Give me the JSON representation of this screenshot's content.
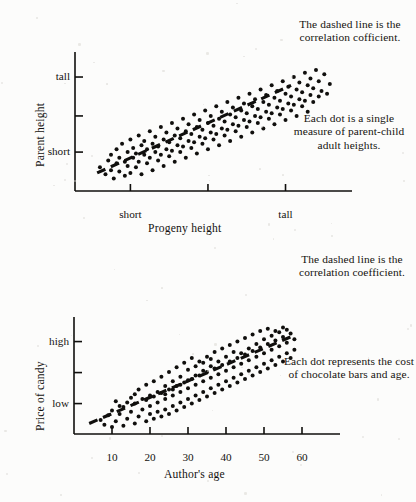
{
  "page": {
    "background_color": "#fcfcfb",
    "ink_color": "#100f0d"
  },
  "figures": [
    {
      "id": "parent-progeny-height",
      "notes": [
        {
          "id": "note-correlation",
          "text": "The dashed line is the correlation cofficient."
        },
        {
          "id": "note-dot-meaning",
          "text": "Each dot is a single measure of parent-child adult heights."
        }
      ],
      "chart_data": {
        "type": "scatter",
        "title": "",
        "xlabel": "Progeny height",
        "ylabel": "Parent height",
        "xlim": [
          0,
          100
        ],
        "ylim": [
          0,
          100
        ],
        "grid": false,
        "legend": "none",
        "xticks": [
          {
            "value": 20,
            "label": "short"
          },
          {
            "value": 48,
            "label": ""
          },
          {
            "value": 76,
            "label": "tall"
          }
        ],
        "yticks": [
          {
            "value": 82,
            "label": "tall"
          },
          {
            "value": 54,
            "label": ""
          },
          {
            "value": 28,
            "label": "short"
          }
        ],
        "annotation_line": {
          "style": "dashed",
          "label": "correlation cofficient",
          "x0": 8,
          "y0": 13,
          "x1": 78,
          "y1": 76
        },
        "points": [
          [
            9,
            17
          ],
          [
            11,
            12
          ],
          [
            12,
            22
          ],
          [
            13,
            15
          ],
          [
            13,
            26
          ],
          [
            14,
            9
          ],
          [
            15,
            20
          ],
          [
            15,
            30
          ],
          [
            16,
            14
          ],
          [
            16,
            24
          ],
          [
            17,
            34
          ],
          [
            18,
            11
          ],
          [
            18,
            21
          ],
          [
            19,
            28
          ],
          [
            19,
            18
          ],
          [
            20,
            37
          ],
          [
            20,
            13
          ],
          [
            21,
            24
          ],
          [
            21,
            31
          ],
          [
            22,
            17
          ],
          [
            22,
            27
          ],
          [
            23,
            40
          ],
          [
            23,
            21
          ],
          [
            24,
            33
          ],
          [
            24,
            12
          ],
          [
            25,
            26
          ],
          [
            25,
            36
          ],
          [
            26,
            20
          ],
          [
            26,
            30
          ],
          [
            27,
            43
          ],
          [
            27,
            24
          ],
          [
            28,
            34
          ],
          [
            28,
            15
          ],
          [
            29,
            28
          ],
          [
            29,
            39
          ],
          [
            30,
            22
          ],
          [
            30,
            32
          ],
          [
            31,
            46
          ],
          [
            31,
            26
          ],
          [
            32,
            37
          ],
          [
            32,
            18
          ],
          [
            33,
            30
          ],
          [
            33,
            42
          ],
          [
            34,
            25
          ],
          [
            34,
            35
          ],
          [
            35,
            49
          ],
          [
            35,
            29
          ],
          [
            36,
            40
          ],
          [
            36,
            21
          ],
          [
            37,
            33
          ],
          [
            37,
            45
          ],
          [
            38,
            28
          ],
          [
            38,
            38
          ],
          [
            39,
            52
          ],
          [
            39,
            32
          ],
          [
            40,
            43
          ],
          [
            40,
            24
          ],
          [
            41,
            36
          ],
          [
            41,
            48
          ],
          [
            42,
            31
          ],
          [
            42,
            41
          ],
          [
            43,
            55
          ],
          [
            43,
            35
          ],
          [
            44,
            46
          ],
          [
            44,
            27
          ],
          [
            45,
            39
          ],
          [
            45,
            51
          ],
          [
            46,
            34
          ],
          [
            46,
            44
          ],
          [
            47,
            58
          ],
          [
            47,
            38
          ],
          [
            48,
            49
          ],
          [
            48,
            30
          ],
          [
            49,
            42
          ],
          [
            49,
            54
          ],
          [
            50,
            37
          ],
          [
            50,
            47
          ],
          [
            51,
            61
          ],
          [
            51,
            41
          ],
          [
            52,
            52
          ],
          [
            52,
            33
          ],
          [
            53,
            45
          ],
          [
            53,
            57
          ],
          [
            54,
            40
          ],
          [
            54,
            50
          ],
          [
            55,
            64
          ],
          [
            55,
            44
          ],
          [
            56,
            55
          ],
          [
            56,
            36
          ],
          [
            57,
            48
          ],
          [
            57,
            60
          ],
          [
            58,
            43
          ],
          [
            58,
            53
          ],
          [
            59,
            67
          ],
          [
            59,
            47
          ],
          [
            60,
            58
          ],
          [
            60,
            39
          ],
          [
            61,
            51
          ],
          [
            61,
            63
          ],
          [
            62,
            46
          ],
          [
            62,
            56
          ],
          [
            63,
            70
          ],
          [
            63,
            50
          ],
          [
            64,
            61
          ],
          [
            64,
            42
          ],
          [
            65,
            54
          ],
          [
            65,
            66
          ],
          [
            66,
            49
          ],
          [
            66,
            59
          ],
          [
            67,
            73
          ],
          [
            67,
            53
          ],
          [
            68,
            64
          ],
          [
            68,
            45
          ],
          [
            69,
            57
          ],
          [
            69,
            69
          ],
          [
            70,
            52
          ],
          [
            70,
            62
          ],
          [
            71,
            76
          ],
          [
            71,
            56
          ],
          [
            72,
            67
          ],
          [
            72,
            48
          ],
          [
            73,
            60
          ],
          [
            73,
            72
          ],
          [
            74,
            55
          ],
          [
            74,
            65
          ],
          [
            75,
            79
          ],
          [
            75,
            59
          ],
          [
            76,
            70
          ],
          [
            76,
            51
          ],
          [
            77,
            63
          ],
          [
            77,
            75
          ],
          [
            78,
            58
          ],
          [
            78,
            68
          ],
          [
            79,
            82
          ],
          [
            79,
            62
          ],
          [
            80,
            73
          ],
          [
            80,
            54
          ],
          [
            81,
            66
          ],
          [
            81,
            78
          ],
          [
            82,
            61
          ],
          [
            82,
            71
          ],
          [
            83,
            85
          ],
          [
            83,
            65
          ],
          [
            84,
            76
          ],
          [
            84,
            57
          ],
          [
            85,
            69
          ],
          [
            85,
            81
          ],
          [
            86,
            64
          ],
          [
            86,
            74
          ],
          [
            87,
            87
          ],
          [
            88,
            68
          ],
          [
            88,
            79
          ],
          [
            89,
            72
          ],
          [
            90,
            84
          ],
          [
            91,
            70
          ],
          [
            92,
            77
          ]
        ]
      }
    },
    {
      "id": "candy-price-author-age",
      "notes": [
        {
          "id": "note-correlation",
          "text": "The dashed line is the correlation coefficient."
        },
        {
          "id": "note-dot-meaning",
          "text": "Each dot represents the cost of chocolate bars and age."
        }
      ],
      "chart_data": {
        "type": "scatter",
        "title": "",
        "xlabel": "Author's age",
        "ylabel": "Price of candy",
        "xlim": [
          0,
          70
        ],
        "ylim": [
          0,
          100
        ],
        "grid": false,
        "legend": "none",
        "xticks": [
          {
            "value": 10,
            "label": "10"
          },
          {
            "value": 20,
            "label": "20"
          },
          {
            "value": 30,
            "label": "30"
          },
          {
            "value": 40,
            "label": "40"
          },
          {
            "value": 50,
            "label": "50"
          },
          {
            "value": 60,
            "label": "60"
          }
        ],
        "yticks": [
          {
            "value": 79,
            "label": "high"
          },
          {
            "value": 26,
            "label": "low"
          }
        ],
        "annotation_line": {
          "style": "dashed",
          "label": "correlation coefficient",
          "x0": 4,
          "y0": 9,
          "x1": 57,
          "y1": 83
        },
        "points": [
          [
            7,
            12
          ],
          [
            8,
            8
          ],
          [
            9,
            16
          ],
          [
            10,
            6
          ],
          [
            10,
            20
          ],
          [
            11,
            11
          ],
          [
            12,
            17
          ],
          [
            13,
            7
          ],
          [
            13,
            23
          ],
          [
            14,
            13
          ],
          [
            15,
            19
          ],
          [
            16,
            9
          ],
          [
            16,
            26
          ],
          [
            17,
            15
          ],
          [
            18,
            21
          ],
          [
            19,
            11
          ],
          [
            19,
            29
          ],
          [
            20,
            17
          ],
          [
            20,
            24
          ],
          [
            21,
            13
          ],
          [
            21,
            32
          ],
          [
            22,
            19
          ],
          [
            22,
            27
          ],
          [
            23,
            15
          ],
          [
            23,
            35
          ],
          [
            24,
            21
          ],
          [
            24,
            30
          ],
          [
            25,
            17
          ],
          [
            25,
            38
          ],
          [
            26,
            24
          ],
          [
            26,
            33
          ],
          [
            27,
            20
          ],
          [
            27,
            41
          ],
          [
            28,
            27
          ],
          [
            28,
            36
          ],
          [
            29,
            23
          ],
          [
            29,
            44
          ],
          [
            30,
            30
          ],
          [
            30,
            39
          ],
          [
            31,
            26
          ],
          [
            31,
            47
          ],
          [
            32,
            33
          ],
          [
            32,
            42
          ],
          [
            33,
            29
          ],
          [
            33,
            50
          ],
          [
            34,
            36
          ],
          [
            34,
            45
          ],
          [
            35,
            32
          ],
          [
            35,
            53
          ],
          [
            36,
            39
          ],
          [
            36,
            48
          ],
          [
            37,
            35
          ],
          [
            37,
            56
          ],
          [
            38,
            42
          ],
          [
            38,
            51
          ],
          [
            39,
            38
          ],
          [
            39,
            59
          ],
          [
            40,
            45
          ],
          [
            40,
            54
          ],
          [
            41,
            41
          ],
          [
            41,
            62
          ],
          [
            42,
            48
          ],
          [
            42,
            57
          ],
          [
            43,
            44
          ],
          [
            43,
            65
          ],
          [
            44,
            51
          ],
          [
            44,
            60
          ],
          [
            45,
            47
          ],
          [
            45,
            68
          ],
          [
            46,
            54
          ],
          [
            46,
            63
          ],
          [
            47,
            50
          ],
          [
            47,
            71
          ],
          [
            48,
            57
          ],
          [
            48,
            66
          ],
          [
            49,
            53
          ],
          [
            49,
            74
          ],
          [
            50,
            60
          ],
          [
            50,
            69
          ],
          [
            51,
            56
          ],
          [
            51,
            77
          ],
          [
            52,
            63
          ],
          [
            52,
            72
          ],
          [
            53,
            59
          ],
          [
            53,
            80
          ],
          [
            54,
            66
          ],
          [
            54,
            75
          ],
          [
            55,
            62
          ],
          [
            55,
            83
          ],
          [
            56,
            69
          ],
          [
            56,
            78
          ],
          [
            57,
            65
          ],
          [
            57,
            86
          ],
          [
            58,
            72
          ],
          [
            58,
            81
          ],
          [
            33,
            62
          ],
          [
            35,
            66
          ],
          [
            37,
            70
          ],
          [
            39,
            73
          ],
          [
            41,
            76
          ],
          [
            43,
            79
          ],
          [
            45,
            82
          ],
          [
            47,
            85
          ],
          [
            49,
            88
          ],
          [
            51,
            90
          ],
          [
            53,
            88
          ],
          [
            55,
            91
          ],
          [
            30,
            55
          ],
          [
            32,
            58
          ],
          [
            34,
            61
          ],
          [
            36,
            64
          ],
          [
            28,
            49
          ],
          [
            26,
            45
          ],
          [
            24,
            41
          ],
          [
            22,
            36
          ],
          [
            20,
            33
          ],
          [
            18,
            30
          ],
          [
            16,
            34
          ],
          [
            17,
            38
          ],
          [
            19,
            42
          ],
          [
            21,
            45
          ],
          [
            23,
            49
          ],
          [
            25,
            53
          ],
          [
            27,
            57
          ],
          [
            29,
            61
          ],
          [
            31,
            65
          ],
          [
            14,
            27
          ],
          [
            12,
            24
          ],
          [
            11,
            28
          ],
          [
            15,
            31
          ],
          [
            44,
            69
          ],
          [
            46,
            73
          ],
          [
            48,
            77
          ],
          [
            50,
            81
          ],
          [
            52,
            84
          ],
          [
            54,
            87
          ],
          [
            56,
            89
          ],
          [
            40,
            66
          ],
          [
            42,
            70
          ],
          [
            38,
            62
          ],
          [
            36,
            58
          ],
          [
            34,
            54
          ],
          [
            32,
            50
          ],
          [
            30,
            46
          ],
          [
            28,
            42
          ],
          [
            26,
            38
          ],
          [
            24,
            34
          ]
        ]
      }
    }
  ]
}
